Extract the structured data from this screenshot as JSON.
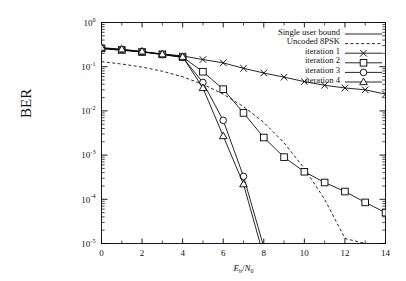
{
  "chart_data": {
    "type": "line",
    "title": "",
    "xlabel": "Eb/N0",
    "xlabel_parts": {
      "num_main": "E",
      "num_sub": "b",
      "slash": "/",
      "den_main": "N",
      "den_sub": "0"
    },
    "ylabel": "BER",
    "xlim": [
      0,
      14
    ],
    "ylim": [
      1e-05,
      1
    ],
    "yscale": "log",
    "grid": false,
    "legend_position": "top-right",
    "xticks": [
      0,
      2,
      4,
      6,
      8,
      10,
      12,
      14
    ],
    "xtick_labels": [
      "0",
      "2",
      "4",
      "6",
      "8",
      "10",
      "12",
      "14"
    ],
    "yticks": [
      1,
      0.1,
      0.01,
      0.001,
      0.0001,
      1e-05
    ],
    "ytick_labels": [
      "10^0",
      "10^-1",
      "10^-2",
      "10^-3",
      "10^-4",
      "10^-5"
    ],
    "ytick_mantissa": "10",
    "ytick_exponents": [
      "0",
      "-1",
      "-2",
      "-3",
      "-4",
      "-5"
    ],
    "series": [
      {
        "name": "Single user bound",
        "style": "solid",
        "marker": "none",
        "color": "#000000",
        "x": [
          7.8,
          8.0
        ],
        "y": [
          1e-05,
          1e-05
        ]
      },
      {
        "name": "Uncoded 8PSK",
        "style": "dashed",
        "marker": "none",
        "color": "#000000",
        "x": [
          0,
          1,
          2,
          3,
          4,
          5,
          6,
          7,
          8,
          9,
          10,
          11,
          12,
          13
        ],
        "y": [
          0.13,
          0.115,
          0.098,
          0.079,
          0.059,
          0.04,
          0.024,
          0.0125,
          0.0055,
          0.0019,
          0.0005,
          0.0001,
          1.3e-05,
          1e-05
        ]
      },
      {
        "name": "iteration 1",
        "style": "solid",
        "marker": "cross",
        "color": "#000000",
        "x": [
          0,
          1,
          2,
          3,
          4,
          5,
          6,
          7,
          8,
          9,
          10,
          11,
          12,
          13,
          14
        ],
        "y": [
          0.255,
          0.235,
          0.215,
          0.195,
          0.175,
          0.145,
          0.122,
          0.092,
          0.072,
          0.058,
          0.046,
          0.038,
          0.033,
          0.03,
          0.024
        ]
      },
      {
        "name": "iteration 2",
        "style": "solid",
        "marker": "square",
        "color": "#000000",
        "x": [
          0,
          1,
          2,
          3,
          4,
          5,
          6,
          7,
          8,
          9,
          10,
          11,
          12,
          13,
          14
        ],
        "y": [
          0.26,
          0.24,
          0.215,
          0.19,
          0.165,
          0.077,
          0.031,
          0.009,
          0.0025,
          0.0009,
          0.00042,
          0.00024,
          0.00015,
          8.5e-05,
          5e-05
        ]
      },
      {
        "name": "iteration 3",
        "style": "solid",
        "marker": "circle",
        "color": "#000000",
        "x": [
          0,
          1,
          2,
          3,
          4,
          5,
          6,
          7,
          7.95
        ],
        "y": [
          0.265,
          0.245,
          0.218,
          0.188,
          0.162,
          0.044,
          0.0061,
          0.00033,
          1e-05
        ]
      },
      {
        "name": "iteration 4",
        "style": "solid",
        "marker": "triangle",
        "color": "#000000",
        "x": [
          0,
          1,
          2,
          3,
          4,
          5,
          6,
          7,
          7.82
        ],
        "y": [
          0.27,
          0.248,
          0.222,
          0.192,
          0.168,
          0.033,
          0.0027,
          0.00022,
          1e-05
        ]
      }
    ]
  },
  "legend": {
    "entries": [
      {
        "label": "Single user bound",
        "style": "solid",
        "marker": "none"
      },
      {
        "label": "Uncoded 8PSK",
        "style": "dashed",
        "marker": "none"
      },
      {
        "label": "iteration 1",
        "style": "solid",
        "marker": "cross"
      },
      {
        "label": "iteration 2",
        "style": "solid",
        "marker": "square"
      },
      {
        "label": "iteration 3",
        "style": "solid",
        "marker": "circle"
      },
      {
        "label": "iteration 4",
        "style": "solid",
        "marker": "triangle"
      }
    ]
  },
  "axes": {
    "y_axis_title": "BER",
    "x_axis_title_num": "E",
    "x_axis_title_num_sub": "b",
    "x_axis_title_den": "N",
    "x_axis_title_den_sub": "0"
  },
  "colors": {
    "line": "#000000",
    "frame": "#000000",
    "background": "#ffffff"
  }
}
